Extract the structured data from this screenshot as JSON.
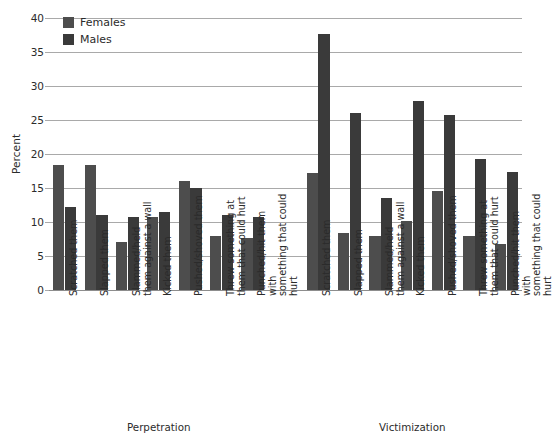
{
  "chart_data": {
    "type": "bar",
    "title": "",
    "subtitle": "",
    "xlabel": "",
    "ylabel": "Percent",
    "ylim": [
      0,
      40
    ],
    "ytick_step": 5,
    "yticks": [
      "40",
      "35",
      "30",
      "25",
      "20",
      "15",
      "10",
      "5",
      "0"
    ],
    "grid": true,
    "legend_position": "top-left",
    "group_labels": [
      "Perpetration",
      "Victimization"
    ],
    "categories": [
      "Scratched them",
      "Slapped them",
      "Slammed/held\nthem against a wall",
      "Kicked them",
      "Pushed/shoved them",
      "Threw something at\nthem that could hurt",
      "Punched/hit them with\nsomething that could hurt"
    ],
    "groups": [
      {
        "name": "Perpetration",
        "series": [
          {
            "name": "Females",
            "values": [
              18.4,
              18.4,
              7.0,
              10.8,
              16.0,
              8.0,
              7.7
            ]
          },
          {
            "name": "Males",
            "values": [
              12.2,
              11.0,
              10.7,
              11.4,
              15.0,
              11.1,
              10.7
            ]
          }
        ]
      },
      {
        "name": "Victimization",
        "series": [
          {
            "name": "Females",
            "values": [
              17.2,
              8.4,
              8.0,
              10.1,
              14.6,
              8.0,
              6.8
            ]
          },
          {
            "name": "Males",
            "values": [
              37.7,
              26.1,
              13.5,
              27.8,
              25.8,
              19.2,
              17.3
            ]
          }
        ]
      }
    ],
    "colors": {
      "females": "#4d4d4d",
      "males": "#3a3a3a",
      "gridline": "#a9a9a9",
      "text": "#2b2b2b",
      "background": "#ffffff"
    }
  },
  "legend": {
    "entries": [
      {
        "label": "Females",
        "color": "#4d4d4d"
      },
      {
        "label": "Males",
        "color": "#3a3a3a"
      }
    ]
  }
}
